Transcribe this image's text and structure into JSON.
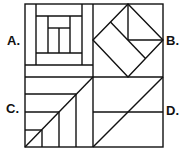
{
  "figure": {
    "type": "quilt-block-options",
    "labels": {
      "a": "A.",
      "b": "B.",
      "c": "C.",
      "d": "D."
    },
    "colors": {
      "stroke": "#111111",
      "background": "#ffffff"
    },
    "blocks": [
      {
        "id": "A",
        "pattern": "log-cabin",
        "description": "Concentric nested rectangular strips with center split vertically"
      },
      {
        "id": "B",
        "pattern": "diamond-in-square",
        "description": "Diamond inscribed in square; upper-right quadrant square; diagonal strip across diamond"
      },
      {
        "id": "C",
        "pattern": "staircase-diagonal",
        "description": "Diagonal from bottom-left to top-right with three horizontal lines on left and three vertical lines below diagonal"
      },
      {
        "id": "D",
        "pattern": "diagonal-with-bar",
        "description": "Diagonal from bottom-left to top-right with one horizontal midline"
      }
    ]
  }
}
